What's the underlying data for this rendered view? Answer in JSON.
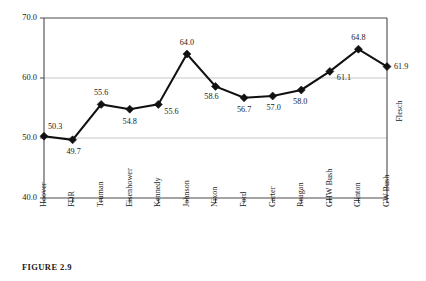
{
  "figure": {
    "caption": "FIGURE 2.9"
  },
  "chart_data": {
    "type": "line",
    "title": "",
    "xlabel": "",
    "ylabel": "",
    "series_label": "Flesch",
    "legend_position": "right-axis-rotated",
    "grid": true,
    "ylim": [
      40.0,
      70.0
    ],
    "ytick_labels": [
      "70.0",
      "60.0",
      "50.0",
      "40.0"
    ],
    "ytick_values": [
      70.0,
      60.0,
      50.0,
      40.0
    ],
    "categories": [
      "Hoover",
      "FDR",
      "Truman",
      "Eisenhower",
      "Kennedy",
      "Johnson",
      "Nixon",
      "Ford",
      "Carter",
      "Reagan",
      "GHW Bush",
      "Clinton",
      "GW Bush"
    ],
    "values": [
      50.3,
      49.7,
      55.6,
      54.8,
      55.6,
      64.0,
      58.6,
      56.7,
      57.0,
      58.0,
      61.1,
      64.8,
      61.9
    ],
    "value_labels": [
      "50.3",
      "49.7",
      "55.6",
      "54.8",
      "55.6",
      "64.0",
      "58.6",
      "56.7",
      "57.0",
      "58.0",
      "61.1",
      "64.8",
      "61.9"
    ],
    "label_offsets": [
      {
        "dx": 4,
        "dy": -9,
        "anchor": "start"
      },
      {
        "dx": 1,
        "dy": 12,
        "anchor": "middle"
      },
      {
        "dx": 0,
        "dy": -11,
        "anchor": "middle"
      },
      {
        "dx": 0,
        "dy": 13,
        "anchor": "middle"
      },
      {
        "dx": 6,
        "dy": 8,
        "anchor": "start"
      },
      {
        "dx": 0,
        "dy": -11,
        "anchor": "middle"
      },
      {
        "dx": -4,
        "dy": 11,
        "anchor": "middle"
      },
      {
        "dx": 0,
        "dy": 12,
        "anchor": "middle"
      },
      {
        "dx": 1,
        "dy": 12,
        "anchor": "middle"
      },
      {
        "dx": -1,
        "dy": 12,
        "anchor": "middle"
      },
      {
        "dx": 7,
        "dy": 7,
        "anchor": "start"
      },
      {
        "dx": 0,
        "dy": -11,
        "anchor": "middle"
      },
      {
        "dx": 7,
        "dy": 1,
        "anchor": "start"
      }
    ]
  },
  "colors": {
    "line": "#111111",
    "marker": "#111111",
    "grid": "#b9b9b9",
    "spine": "#4a4a4a",
    "text": "#1a1a1a",
    "background": "#ffffff"
  }
}
